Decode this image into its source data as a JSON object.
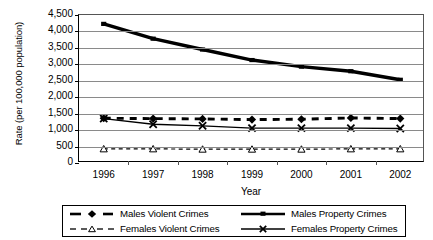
{
  "chart_data": {
    "type": "line",
    "title": "",
    "xlabel": "Year",
    "ylabel": "Rate (per 100,000 population)",
    "categories": [
      "1996",
      "1997",
      "1998",
      "1999",
      "2000",
      "2001",
      "2002"
    ],
    "ylim": [
      0,
      4500
    ],
    "ytick_labels": [
      "0",
      "500",
      "1,000",
      "1,500",
      "2,000",
      "2,500",
      "3,000",
      "3,500",
      "4,000",
      "4,500"
    ],
    "ytick_values": [
      0,
      500,
      1000,
      1500,
      2000,
      2500,
      3000,
      3500,
      4000,
      4500
    ],
    "grid": true,
    "legend_position": "bottom",
    "series": [
      {
        "name": "Males Violent Crimes",
        "style": "thick-dashed",
        "marker": "diamond",
        "color": "#000000",
        "values": [
          1360,
          1350,
          1340,
          1320,
          1330,
          1370,
          1350
        ]
      },
      {
        "name": "Females Violent Crimes",
        "style": "thin-dashed",
        "marker": "triangle-open",
        "color": "#000000",
        "values": [
          430,
          430,
          420,
          420,
          420,
          430,
          430
        ]
      },
      {
        "name": "Males Property Crimes",
        "style": "thick-solid",
        "marker": "square",
        "color": "#000000",
        "values": [
          4230,
          3780,
          3450,
          3130,
          2930,
          2790,
          2530
        ]
      },
      {
        "name": "Females Property Crimes",
        "style": "thin-solid",
        "marker": "x",
        "color": "#000000",
        "values": [
          1350,
          1180,
          1130,
          1060,
          1060,
          1060,
          1050
        ]
      }
    ]
  },
  "legend": {
    "entries": [
      {
        "label": "Males Violent Crimes"
      },
      {
        "label": "Males Property Crimes"
      },
      {
        "label": "Females Violent Crimes"
      },
      {
        "label": "Females Property Crimes"
      }
    ]
  }
}
